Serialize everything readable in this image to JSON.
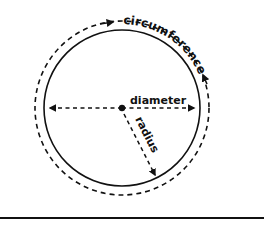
{
  "diagram": {
    "labels": {
      "circumference": "circumference",
      "diameter": "diameter",
      "radius": "radius"
    },
    "colors": {
      "stroke": "#111111",
      "background": "#ffffff"
    }
  }
}
